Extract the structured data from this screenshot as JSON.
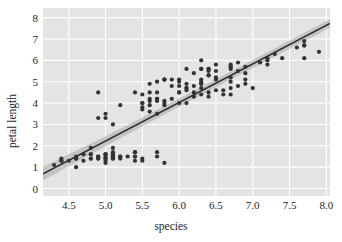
{
  "chart_data": {
    "type": "scatter",
    "title": "",
    "xlabel": "species",
    "ylabel": "petal length",
    "xlim": [
      4.15,
      8.05
    ],
    "ylim": [
      -0.35,
      8.45
    ],
    "xticks": [
      "4.5",
      "5.0",
      "5.5",
      "6.0",
      "6.5",
      "7.0",
      "7.5",
      "8.0"
    ],
    "xtick_values": [
      4.5,
      5.0,
      5.5,
      6.0,
      6.5,
      7.0,
      7.5,
      8.0
    ],
    "yticks": [
      "0",
      "1",
      "2",
      "3",
      "4",
      "5",
      "6",
      "7",
      "8"
    ],
    "ytick_values": [
      0,
      1,
      2,
      3,
      4,
      5,
      6,
      7,
      8
    ],
    "grid": true,
    "grid_color": "#ffffff",
    "plot_bg": "#e4e4e4",
    "figure_bg": "#ffffff",
    "point_color": "#333333",
    "line_color": "#2a2a2a",
    "band_color": "#a8a8a8",
    "legend": null,
    "regression_line": {
      "x": [
        4.15,
        8.05
      ],
      "y": [
        0.69,
        7.73
      ],
      "slope": 1.806,
      "intercept": -6.805
    },
    "confidence_band": {
      "x": [
        4.15,
        5.0,
        5.843,
        7.0,
        8.05
      ],
      "y_upper": [
        1.02,
        2.45,
        3.93,
        6.02,
        7.94
      ],
      "y_lower": [
        0.38,
        1.98,
        3.55,
        5.64,
        7.52
      ]
    },
    "x": [
      5.1,
      4.9,
      4.7,
      4.6,
      5.0,
      5.4,
      4.6,
      5.0,
      4.4,
      4.9,
      5.4,
      4.8,
      4.8,
      4.3,
      5.8,
      5.7,
      5.4,
      5.1,
      5.7,
      5.1,
      5.4,
      5.1,
      4.6,
      5.1,
      4.8,
      5.0,
      5.0,
      5.2,
      5.2,
      4.7,
      4.8,
      5.4,
      5.2,
      5.5,
      4.9,
      5.0,
      5.5,
      4.9,
      4.4,
      5.1,
      5.0,
      4.5,
      4.4,
      5.0,
      5.1,
      4.8,
      5.1,
      4.6,
      5.3,
      5.0,
      7.0,
      6.4,
      6.9,
      5.5,
      6.5,
      5.7,
      6.3,
      4.9,
      6.6,
      5.2,
      5.0,
      5.9,
      6.0,
      6.1,
      5.6,
      6.7,
      5.6,
      5.8,
      6.2,
      5.6,
      5.9,
      6.1,
      6.3,
      6.1,
      6.4,
      6.6,
      6.8,
      6.7,
      6.0,
      5.7,
      5.5,
      5.5,
      5.8,
      6.0,
      5.4,
      6.0,
      6.7,
      6.3,
      5.6,
      5.5,
      5.5,
      6.1,
      5.8,
      5.0,
      5.6,
      5.7,
      5.7,
      6.2,
      5.1,
      5.7,
      6.3,
      5.8,
      7.1,
      6.3,
      6.5,
      7.6,
      4.9,
      7.3,
      6.7,
      7.2,
      6.5,
      6.4,
      6.8,
      5.7,
      5.8,
      6.4,
      6.5,
      7.7,
      7.7,
      6.0,
      6.9,
      5.6,
      7.7,
      6.3,
      6.7,
      7.2,
      6.2,
      6.1,
      6.4,
      7.2,
      7.4,
      7.9,
      6.4,
      6.3,
      6.1,
      7.7,
      6.3,
      6.4,
      6.0,
      6.9,
      6.7,
      6.9,
      5.8,
      6.8,
      6.7,
      6.7,
      6.3,
      6.5,
      6.2,
      5.9
    ],
    "y": [
      1.4,
      1.4,
      1.3,
      1.5,
      1.4,
      1.7,
      1.4,
      1.5,
      1.4,
      1.5,
      1.5,
      1.6,
      1.4,
      1.1,
      1.2,
      1.5,
      1.3,
      1.4,
      1.7,
      1.5,
      1.7,
      1.5,
      1.0,
      1.7,
      1.9,
      1.6,
      1.6,
      1.5,
      1.4,
      1.6,
      1.6,
      1.5,
      1.5,
      1.4,
      1.5,
      1.2,
      1.3,
      1.4,
      1.3,
      1.5,
      1.3,
      1.3,
      1.3,
      1.6,
      1.9,
      1.4,
      1.6,
      1.4,
      1.5,
      1.4,
      4.7,
      4.5,
      4.9,
      4.0,
      4.6,
      4.5,
      4.7,
      3.3,
      4.6,
      3.9,
      3.5,
      4.2,
      4.0,
      4.7,
      3.6,
      4.4,
      4.5,
      4.1,
      4.5,
      3.9,
      4.8,
      4.0,
      4.9,
      4.7,
      4.3,
      4.4,
      4.8,
      5.0,
      4.5,
      3.5,
      3.8,
      3.7,
      3.9,
      5.1,
      4.5,
      4.5,
      4.7,
      4.4,
      4.1,
      4.0,
      4.4,
      4.6,
      4.0,
      3.3,
      4.2,
      4.2,
      4.2,
      4.3,
      3.0,
      4.1,
      6.0,
      5.1,
      5.9,
      5.6,
      5.8,
      6.6,
      4.5,
      6.3,
      5.8,
      6.1,
      5.1,
      5.3,
      5.5,
      5.0,
      5.1,
      5.3,
      5.5,
      6.7,
      6.9,
      5.0,
      5.7,
      4.9,
      6.7,
      4.9,
      5.7,
      6.0,
      4.8,
      4.9,
      5.6,
      5.8,
      6.1,
      6.4,
      5.6,
      5.1,
      5.6,
      6.1,
      5.6,
      5.5,
      4.8,
      5.4,
      5.6,
      5.1,
      5.1,
      5.9,
      5.7,
      5.2,
      5.0,
      5.2,
      5.4,
      5.1
    ]
  }
}
